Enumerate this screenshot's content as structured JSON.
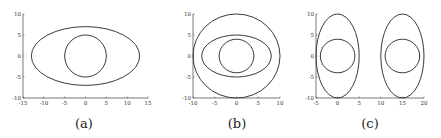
{
  "chart_data": [
    {
      "type": "line",
      "title": "",
      "caption": "(a)",
      "xlabel": "",
      "ylabel": "",
      "xlim": [
        -15,
        15
      ],
      "ylim": [
        -10,
        10
      ],
      "xticks": [
        -15,
        -10,
        -5,
        0,
        5,
        10,
        15
      ],
      "yticks": [
        -10,
        -5,
        0,
        5,
        10
      ],
      "grid": false,
      "shapes": [
        {
          "kind": "ellipse",
          "cx": 0,
          "cy": 0,
          "rx": 13,
          "ry": 7
        },
        {
          "kind": "circle",
          "cx": 0,
          "cy": 0,
          "rx": 5,
          "ry": 5
        }
      ]
    },
    {
      "type": "line",
      "title": "",
      "caption": "(b)",
      "xlabel": "",
      "ylabel": "",
      "xlim": [
        -10,
        10
      ],
      "ylim": [
        -10,
        10
      ],
      "xticks": [
        -10,
        -5,
        0,
        5,
        10
      ],
      "yticks": [
        -10,
        -5,
        0,
        5,
        10
      ],
      "grid": false,
      "shapes": [
        {
          "kind": "circle",
          "cx": 0,
          "cy": 0,
          "rx": 10,
          "ry": 10
        },
        {
          "kind": "ellipse",
          "cx": 0,
          "cy": 0,
          "rx": 8,
          "ry": 5
        },
        {
          "kind": "circle",
          "cx": 0,
          "cy": 0,
          "rx": 4,
          "ry": 4
        }
      ]
    },
    {
      "type": "line",
      "title": "",
      "caption": "(c)",
      "xlabel": "",
      "ylabel": "",
      "xlim": [
        -5,
        20
      ],
      "ylim": [
        -10,
        10
      ],
      "xticks": [
        -5,
        0,
        5,
        10,
        15,
        20
      ],
      "yticks": [
        -10,
        -5,
        0,
        5,
        10
      ],
      "grid": false,
      "shapes": [
        {
          "kind": "ellipse",
          "cx": 0,
          "cy": 0,
          "rx": 5,
          "ry": 10
        },
        {
          "kind": "circle",
          "cx": 0,
          "cy": 0,
          "rx": 4,
          "ry": 4
        },
        {
          "kind": "ellipse",
          "cx": 15,
          "cy": 0,
          "rx": 5,
          "ry": 10
        },
        {
          "kind": "circle",
          "cx": 15,
          "cy": 0,
          "rx": 4,
          "ry": 4
        }
      ]
    }
  ],
  "layout": [
    {
      "x0": 23,
      "x1": 148,
      "y0": 98,
      "y1": 14,
      "cap_x": 84,
      "cap_y": 128
    },
    {
      "x0": 193,
      "x1": 280,
      "y0": 98,
      "y1": 14,
      "cap_x": 237,
      "cap_y": 128
    },
    {
      "x0": 316,
      "x1": 424,
      "y0": 98,
      "y1": 14,
      "cap_x": 370,
      "cap_y": 128
    }
  ],
  "colors": {
    "line": "#3a3a3a",
    "axis": "#555555",
    "background": "#ffffff"
  }
}
